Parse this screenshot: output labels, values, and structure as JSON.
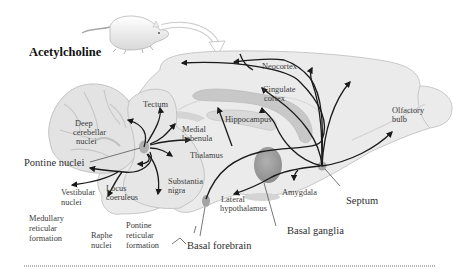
{
  "title": "Acetylcholine",
  "colors": {
    "brain_fill": "#e9e9e9",
    "brain_outline": "#bdbdbd",
    "cerebellum_fill": "#e4e4e4",
    "hippocampus_fill": "#c9c9c9",
    "nucleus_fill": "#a6a6a6",
    "basal_ganglia_fill": "#9a9a9a",
    "pathway_stroke": "#1a1a1a",
    "label_color": "#3a3a3a"
  },
  "labels": {
    "neocortex": "Neocortex",
    "cingulate_cortex_1": "Cingulate",
    "cingulate_cortex_2": "cortex",
    "olfactory_bulb_1": "Olfactory",
    "olfactory_bulb_2": "bulb",
    "hippocampus": "Hippocampus",
    "tectum": "Tectum",
    "deep_cerebellar_1": "Deep",
    "deep_cerebellar_2": "cerebellar",
    "deep_cerebellar_3": "nuclei",
    "medial_habenula_1": "Medial",
    "medial_habenula_2": "habenula",
    "pontine_nuclei": "Pontine nuclei",
    "thalamus": "Thalamus",
    "substantia_nigra_1": "Substantia",
    "substantia_nigra_2": "nigra",
    "locus_coeruleus_1": "Locus",
    "locus_coeruleus_2": "coeruleus",
    "vestibular_nuclei_1": "Vestibular",
    "vestibular_nuclei_2": "nuclei",
    "medullary_rf_1": "Medullary",
    "medullary_rf_2": "reticular",
    "medullary_rf_3": "formation",
    "raphe_nuclei_1": "Raphe",
    "raphe_nuclei_2": "nuclei",
    "pontine_rf_1": "Pontine",
    "pontine_rf_2": "reticular",
    "pontine_rf_3": "formation",
    "lateral_hypothalamus_1": "Lateral",
    "lateral_hypothalamus_2": "hypothalamus",
    "amygdala": "Amygdala",
    "septum": "Septum",
    "basal_ganglia": "Basal ganglia",
    "basal_forebrain": "Basal forebrain"
  }
}
